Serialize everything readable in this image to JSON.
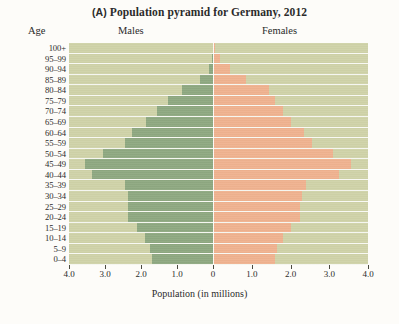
{
  "figure": {
    "panel_letter": "(A)",
    "title": "Population pyramid for Germany, 2012",
    "age_header": "Age",
    "males_header": "Males",
    "females_header": "Females",
    "axis_title": "Population (in millions)",
    "male_color": "#8ea881",
    "female_color": "#efb28f",
    "plot_background": "#cfd2a8"
  },
  "chart_data": {
    "type": "bar",
    "subtype": "population-pyramid",
    "title": "(A) Population pyramid for Germany, 2012",
    "xlabel": "Population (in millions)",
    "ylabel": "Age",
    "xlim": [
      -4.0,
      4.0
    ],
    "xticks": [
      -4.0,
      -3.0,
      -2.0,
      -1.0,
      0,
      1.0,
      2.0,
      3.0,
      4.0
    ],
    "xtick_labels": [
      "4.0",
      "3.0",
      "2.0",
      "1.0",
      "0",
      "1.0",
      "2.0",
      "3.0",
      "4.0"
    ],
    "grid": false,
    "legend_position": "top-columns",
    "categories": [
      "100+",
      "95–99",
      "90–94",
      "85–89",
      "80–84",
      "75–79",
      "70–74",
      "65–69",
      "60–64",
      "55–59",
      "50–54",
      "45–49",
      "40–44",
      "35–39",
      "30–34",
      "25–29",
      "20–24",
      "15–19",
      "10–14",
      "5–9",
      "0–4"
    ],
    "series": [
      {
        "name": "Males",
        "color": "#8ea881",
        "side": "left",
        "values": [
          0.01,
          0.04,
          0.12,
          0.35,
          0.85,
          1.25,
          1.55,
          1.85,
          2.25,
          2.45,
          3.05,
          3.55,
          3.35,
          2.45,
          2.35,
          2.35,
          2.35,
          2.1,
          1.9,
          1.75,
          1.7
        ]
      },
      {
        "name": "Females",
        "color": "#efb28f",
        "side": "right",
        "values": [
          0.05,
          0.17,
          0.45,
          0.85,
          1.45,
          1.6,
          1.8,
          2.0,
          2.35,
          2.55,
          3.1,
          3.55,
          3.25,
          2.4,
          2.3,
          2.25,
          2.25,
          2.0,
          1.8,
          1.65,
          1.6
        ]
      }
    ]
  }
}
